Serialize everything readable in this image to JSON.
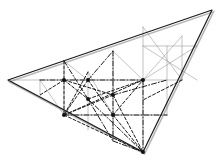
{
  "figure": {
    "canvas": {
      "width": 217,
      "height": 163,
      "background": "#ffffff"
    },
    "colors": {
      "outline": "#1a1a1a",
      "grid": "#9a9a9a",
      "construction": "#1a1a1a",
      "node": "#111111",
      "shadow": "#b8b8b8"
    },
    "stroke_widths": {
      "outline": 1.2,
      "grid": 0.6,
      "construction": 1.0
    },
    "main_triangle": {
      "label": "outer-triangle",
      "vertices": [
        {
          "name": "left-apex",
          "x": 8,
          "y": 80
        },
        {
          "name": "top-right-apex",
          "x": 212,
          "y": 10
        },
        {
          "name": "bottom-apex",
          "x": 143,
          "y": 152
        }
      ]
    },
    "grid_lines": {
      "horizontals": [
        {
          "name": "upper-horizontal",
          "x1": 143,
          "y1": 46,
          "x2": 197,
          "y2": 46
        },
        {
          "name": "mid-horizontal",
          "x1": 8,
          "y1": 80,
          "x2": 182,
          "y2": 80
        },
        {
          "name": "lower-horizontal",
          "x1": 64,
          "y1": 115,
          "x2": 167,
          "y2": 115
        }
      ],
      "verticals": [
        {
          "name": "v1",
          "x": 40,
          "y1": 80,
          "y2": 95
        },
        {
          "name": "v2",
          "x": 64,
          "y1": 61,
          "y2": 115
        },
        {
          "name": "v3",
          "x": 88,
          "y1": 72,
          "y2": 130
        },
        {
          "name": "v4",
          "x": 113,
          "y1": 51,
          "y2": 141
        },
        {
          "name": "v5",
          "x": 143,
          "y1": 27,
          "y2": 152
        },
        {
          "name": "v6",
          "x": 167,
          "y1": 46,
          "y2": 115
        },
        {
          "name": "v7",
          "x": 182,
          "y1": 36,
          "y2": 80
        }
      ],
      "diagonals": [
        {
          "name": "d1",
          "x1": 40,
          "y1": 80,
          "x2": 64,
          "y2": 115
        },
        {
          "name": "d2",
          "x1": 64,
          "y1": 61,
          "x2": 88,
          "y2": 80
        },
        {
          "name": "d3",
          "x1": 88,
          "y1": 72,
          "x2": 113,
          "y2": 115
        },
        {
          "name": "d4",
          "x1": 143,
          "y1": 46,
          "x2": 197,
          "y2": 80
        },
        {
          "name": "d5",
          "x1": 197,
          "y1": 46,
          "x2": 143,
          "y2": 80
        },
        {
          "name": "d6",
          "x1": 143,
          "y1": 27,
          "x2": 182,
          "y2": 80
        },
        {
          "name": "d7",
          "x1": 182,
          "y1": 36,
          "x2": 143,
          "y2": 80
        },
        {
          "name": "d8",
          "x1": 113,
          "y1": 51,
          "x2": 143,
          "y2": 80
        }
      ]
    },
    "nodes": [
      {
        "name": "node-a",
        "x": 64,
        "y": 80
      },
      {
        "name": "node-b",
        "x": 88,
        "y": 80
      },
      {
        "name": "node-c",
        "x": 64,
        "y": 115
      },
      {
        "name": "node-d",
        "x": 113,
        "y": 115
      },
      {
        "name": "node-e",
        "x": 143,
        "y": 80
      },
      {
        "name": "node-f",
        "x": 143,
        "y": 152
      },
      {
        "name": "node-g",
        "x": 113,
        "y": 95
      },
      {
        "name": "node-h",
        "x": 88,
        "y": 99
      }
    ],
    "construction_lines": {
      "dashed": [
        {
          "name": "dash-1",
          "x1": 64,
          "y1": 61,
          "x2": 64,
          "y2": 115
        },
        {
          "name": "dash-2",
          "x1": 88,
          "y1": 72,
          "x2": 64,
          "y2": 115
        },
        {
          "name": "dash-3",
          "x1": 64,
          "y1": 80,
          "x2": 113,
          "y2": 95
        },
        {
          "name": "dash-4",
          "x1": 64,
          "y1": 80,
          "x2": 88,
          "y2": 99
        },
        {
          "name": "dash-5",
          "x1": 88,
          "y1": 80,
          "x2": 64,
          "y2": 115
        },
        {
          "name": "dash-6",
          "x1": 88,
          "y1": 80,
          "x2": 113,
          "y2": 115
        },
        {
          "name": "dash-7",
          "x1": 64,
          "y1": 115,
          "x2": 143,
          "y2": 80
        },
        {
          "name": "dash-8",
          "x1": 64,
          "y1": 115,
          "x2": 113,
          "y2": 95
        },
        {
          "name": "dash-9",
          "x1": 64,
          "y1": 115,
          "x2": 143,
          "y2": 152
        },
        {
          "name": "dash-10",
          "x1": 113,
          "y1": 95,
          "x2": 143,
          "y2": 152
        },
        {
          "name": "dash-11",
          "x1": 113,
          "y1": 115,
          "x2": 143,
          "y2": 80
        },
        {
          "name": "dash-12",
          "x1": 88,
          "y1": 99,
          "x2": 143,
          "y2": 80
        },
        {
          "name": "dash-13",
          "x1": 64,
          "y1": 80,
          "x2": 40,
          "y2": 95
        },
        {
          "name": "dash-14",
          "x1": 113,
          "y1": 115,
          "x2": 143,
          "y2": 152
        },
        {
          "name": "dash-15",
          "x1": 182,
          "y1": 80,
          "x2": 143,
          "y2": 100
        }
      ],
      "dash_dot": [
        {
          "name": "dashdot-1",
          "x1": 88,
          "y1": 80,
          "x2": 113,
          "y2": 51
        },
        {
          "name": "dashdot-2",
          "x1": 113,
          "y1": 51,
          "x2": 113,
          "y2": 141
        },
        {
          "name": "dashdot-3",
          "x1": 40,
          "y1": 80,
          "x2": 143,
          "y2": 80
        },
        {
          "name": "dashdot-4",
          "x1": 64,
          "y1": 115,
          "x2": 167,
          "y2": 115
        },
        {
          "name": "dashdot-5",
          "x1": 64,
          "y1": 61,
          "x2": 88,
          "y2": 99
        },
        {
          "name": "dashdot-6",
          "x1": 88,
          "y1": 99,
          "x2": 143,
          "y2": 152
        },
        {
          "name": "dashdot-7",
          "x1": 113,
          "y1": 95,
          "x2": 167,
          "y2": 80
        },
        {
          "name": "dashdot-8",
          "x1": 113,
          "y1": 141,
          "x2": 143,
          "y2": 152
        },
        {
          "name": "dashdot-9",
          "x1": 143,
          "y1": 80,
          "x2": 143,
          "y2": 152
        },
        {
          "name": "dashdot-10",
          "x1": 88,
          "y1": 99,
          "x2": 113,
          "y2": 141
        }
      ]
    }
  }
}
